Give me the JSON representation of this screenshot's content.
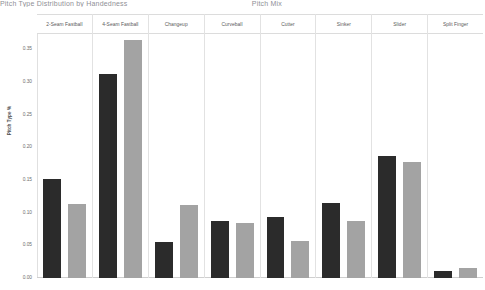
{
  "clipped_header": {
    "left_fragment": "Pitch Type Distribution by Handedness",
    "right_fragment": "Pitch Mix"
  },
  "chart_data": {
    "type": "bar",
    "title": "",
    "xlabel": "",
    "ylabel": "Pitch Type %",
    "ylim": [
      0.0,
      0.375
    ],
    "ytick_labels": [
      "0.35",
      "0.30",
      "0.25",
      "0.20",
      "0.15",
      "0.10",
      "0.05",
      "0.00"
    ],
    "ytick_values": [
      0.35,
      0.3,
      0.25,
      0.2,
      0.15,
      0.1,
      0.05,
      0.0
    ],
    "grid": false,
    "legend_position": "none",
    "facet_layout": "columns",
    "categories": [
      "2-Seam Fastball",
      "4-Seam Fastball",
      "Changeup",
      "Curveball",
      "Cutter",
      "Sinker",
      "Slider",
      "Split Finger"
    ],
    "series": [
      {
        "name": "series-dark",
        "color": "#2b2b2b",
        "values": [
          0.152,
          0.312,
          0.055,
          0.088,
          0.093,
          0.115,
          0.186,
          0.01
        ]
      },
      {
        "name": "series-light",
        "color": "#a3a3a3",
        "values": [
          0.113,
          0.365,
          0.112,
          0.084,
          0.057,
          0.088,
          0.178,
          0.015
        ]
      }
    ]
  },
  "colors": {
    "dark_bar": "#2b2b2b",
    "light_bar": "#a3a3a3",
    "panel_border": "#dcdcdc",
    "text": "#595959",
    "background": "#ffffff"
  }
}
